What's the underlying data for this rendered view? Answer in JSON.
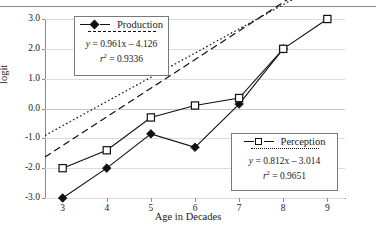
{
  "chart_data": {
    "type": "line",
    "title": "",
    "xlabel": "Age in Decades",
    "ylabel": "logit",
    "x": [
      3,
      4,
      5,
      6,
      7,
      8,
      9
    ],
    "xlim": [
      2.6,
      9.4
    ],
    "ylim": [
      -3.0,
      3.0
    ],
    "xticks": [
      "3",
      "4",
      "5",
      "6",
      "7",
      "8",
      "9"
    ],
    "yticks": [
      "3.0",
      "2.0",
      "1.0",
      "0.0",
      "-1.0",
      "-2.0",
      "-3.0"
    ],
    "ytick_values": [
      3.0,
      2.0,
      1.0,
      0.0,
      -1.0,
      -2.0,
      -3.0
    ],
    "grid": true,
    "legend_position": "inside",
    "series": [
      {
        "name": "Production",
        "marker": "filled-diamond",
        "x": [
          3,
          4,
          5,
          6,
          7,
          8
        ],
        "values": [
          -3.0,
          -2.0,
          -0.85,
          -1.3,
          0.15,
          2.0
        ],
        "trendline": {
          "equation": "y = 0.961x - 4.126",
          "r2_label": "r",
          "r2_exp": "2",
          "r2_value": "= 0.9336",
          "slope": 0.961,
          "intercept": -4.126,
          "style": "dashed"
        }
      },
      {
        "name": "Perception",
        "marker": "open-square",
        "x": [
          3,
          4,
          5,
          6,
          7,
          8,
          9
        ],
        "values": [
          -2.0,
          -1.4,
          -0.3,
          0.1,
          0.35,
          2.0,
          3.0
        ],
        "trendline": {
          "equation": "y = 0.812x - 3.014",
          "r2_label": "r",
          "r2_exp": "2",
          "r2_value": "= 0.9651",
          "slope": 0.812,
          "intercept": -3.014,
          "style": "dotted"
        }
      }
    ]
  },
  "legends": {
    "production": {
      "name": "Production",
      "equation": "y = 0.961x – 4.126",
      "eq_lhs": "y",
      "eq_rhs": "= 0.961x – 4.126",
      "r_symbol": "r",
      "r_exp": "2",
      "r_value": "= 0.9336"
    },
    "perception": {
      "name": "Perception",
      "equation": "y = 0.812x – 3.014",
      "eq_lhs": "y",
      "eq_rhs": "= 0.812x – 3.014",
      "r_symbol": "r",
      "r_exp": "2",
      "r_value": "= 0.9651"
    }
  },
  "colors": {
    "axis": "#8a8a8a",
    "grid": "#dcdcdc",
    "ink": "#111111",
    "background": "#ffffff"
  }
}
